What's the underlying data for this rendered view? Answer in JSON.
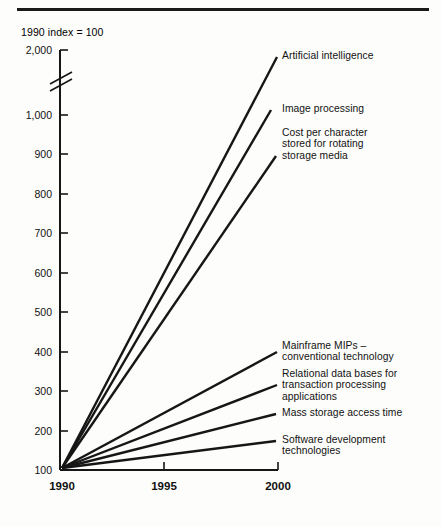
{
  "figure": {
    "subtitle": "1990 index = 100",
    "background_color": "#fdfdfb",
    "line_color": "#161616"
  },
  "chart_data": {
    "type": "line",
    "title": "",
    "subtitle": "1990 index = 100",
    "xlabel": "",
    "ylabel": "",
    "x": [
      1990,
      2000
    ],
    "xlim": [
      1990,
      2000
    ],
    "xticks": [
      1990,
      1995,
      2000
    ],
    "xtick_labels": [
      "1990",
      "1995",
      "2000"
    ],
    "yticks": [
      100,
      200,
      300,
      400,
      500,
      600,
      700,
      800,
      900,
      1000,
      2000
    ],
    "ytick_labels": [
      "100",
      "200",
      "300",
      "400",
      "500",
      "600",
      "700",
      "800",
      "900",
      "1,000",
      "2,000"
    ],
    "ylim": [
      100,
      2000
    ],
    "y_axis_break": true,
    "y_axis_break_between": [
      1000,
      2000
    ],
    "grid": false,
    "legend_position": "right-inline",
    "series": [
      {
        "name": "Artificial intelligence",
        "values": [
          100,
          1950
        ],
        "label": "Artificial intelligence"
      },
      {
        "name": "Image processing",
        "values": [
          100,
          1020
        ],
        "label": "Image processing"
      },
      {
        "name": "Cost per character stored for rotating storage media",
        "values": [
          100,
          870
        ],
        "label": "Cost per character\nstored for rotating\nstorage media"
      },
      {
        "name": "Mainframe MIPs - conventional technology",
        "values": [
          100,
          410
        ],
        "label": "Mainframe MIPs –\nconventional technology"
      },
      {
        "name": "Relational data bases for transaction processing applications",
        "values": [
          100,
          325
        ],
        "label": "Relational data bases for\ntransaction processing\napplications"
      },
      {
        "name": "Mass storage access time",
        "values": [
          100,
          240
        ],
        "label": "Mass storage access time"
      },
      {
        "name": "Software development technologies",
        "values": [
          100,
          175
        ],
        "label": "Software development\ntechnologies"
      }
    ]
  }
}
